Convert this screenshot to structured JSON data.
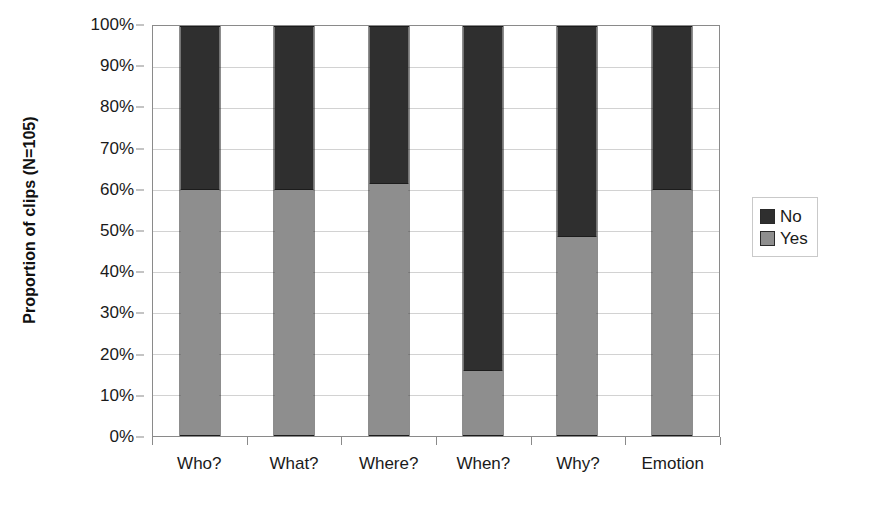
{
  "chart_data": {
    "type": "bar",
    "subtype": "stacked-100-percent",
    "title": "",
    "xlabel": "",
    "ylabel": "Proportion of clips (N=105)",
    "categories": [
      "Who?",
      "What?",
      "Where?",
      "When?",
      "Why?",
      "Emotion"
    ],
    "series": [
      {
        "name": "No",
        "color": "#2f2f2f",
        "values": [
          40.0,
          40.0,
          38.6,
          84.3,
          51.4,
          40.0
        ]
      },
      {
        "name": "Yes",
        "color": "#8e8e8e",
        "values": [
          60.0,
          60.0,
          61.4,
          15.7,
          48.6,
          60.0
        ]
      }
    ],
    "stack_order_top_to_bottom": [
      "No",
      "Yes"
    ],
    "ylim": [
      0,
      100
    ],
    "yticks": [
      0,
      10,
      20,
      30,
      40,
      50,
      60,
      70,
      80,
      90,
      100
    ],
    "ytick_labels": [
      "0%",
      "10%",
      "20%",
      "30%",
      "40%",
      "50%",
      "60%",
      "70%",
      "80%",
      "90%",
      "100%"
    ],
    "grid": "horizontal",
    "legend_position": "right",
    "legend_entries": [
      "No",
      "Yes"
    ]
  },
  "axis": {
    "y_title": "Proportion of clips (N=105)",
    "y_tick_labels": [
      "100%",
      "90%",
      "80%",
      "70%",
      "60%",
      "50%",
      "40%",
      "30%",
      "20%",
      "10%",
      "0%"
    ],
    "x_tick_labels": [
      "Who?",
      "What?",
      "Where?",
      "When?",
      "Why?",
      "Emotion"
    ]
  },
  "legend": {
    "items": [
      {
        "label": "No",
        "color": "#2f2f2f"
      },
      {
        "label": "Yes",
        "color": "#8e8e8e"
      }
    ]
  }
}
